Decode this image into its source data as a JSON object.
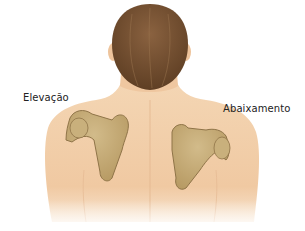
{
  "figure": {
    "labels": {
      "left": "Elevação",
      "right": "Abaixamento"
    },
    "colors": {
      "background": "#ffffff",
      "skin": "#f2cfaa",
      "skin_shadow": "#e3b48c",
      "hair": "#7a5534",
      "hair_dark": "#5c3d22",
      "bone": "#c7ad7a",
      "bone_outline": "#8f7448",
      "text": "#222222"
    }
  }
}
